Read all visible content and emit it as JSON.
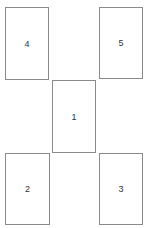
{
  "diagram": {
    "boxes": [
      {
        "id": "box-4",
        "label": "4",
        "x": 5,
        "y": 7,
        "w": 44,
        "h": 73
      },
      {
        "id": "box-5",
        "label": "5",
        "x": 99,
        "y": 7,
        "w": 44,
        "h": 72
      },
      {
        "id": "box-1",
        "label": "1",
        "x": 52,
        "y": 80,
        "w": 44,
        "h": 73
      },
      {
        "id": "box-2",
        "label": "2",
        "x": 5,
        "y": 153,
        "w": 45,
        "h": 72
      },
      {
        "id": "box-3",
        "label": "3",
        "x": 99,
        "y": 153,
        "w": 44,
        "h": 72
      }
    ],
    "colors": {
      "border": "#8a8a8a",
      "background": "#ffffff",
      "text": "#333333"
    }
  }
}
